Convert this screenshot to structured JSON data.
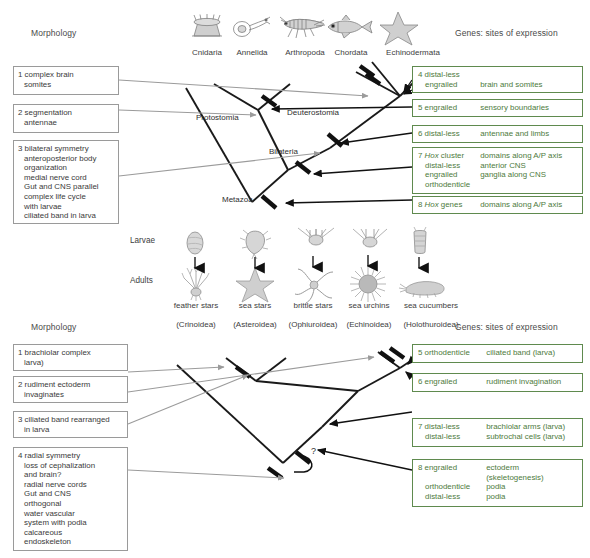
{
  "panels": {
    "top": {
      "left_header": "Morphology",
      "right_header": "Genes: sites of expression",
      "taxa": [
        {
          "name": "Cnidaria",
          "icon": "cnidaria-polyp-icon"
        },
        {
          "name": "Annelida",
          "icon": "annelida-worm-icon"
        },
        {
          "name": "Arthropoda",
          "icon": "arthropoda-insect-icon"
        },
        {
          "name": "Chordata",
          "icon": "chordata-fish-icon"
        },
        {
          "name": "Echinodermata",
          "icon": "echinodermata-star-icon"
        }
      ],
      "morphology_boxes": [
        {
          "num": "1",
          "lines": [
            "complex brain",
            "somites"
          ]
        },
        {
          "num": "2",
          "lines": [
            "segmentation",
            "antennae"
          ]
        },
        {
          "num": "3",
          "lines": [
            "bilateral symmetry",
            "anteroposterior body",
            "organization",
            "medial nerve cord",
            "Gut and CNS parallel",
            "complex life cycle",
            "with larvae",
            "ciliated band in larva"
          ]
        }
      ],
      "gene_boxes": [
        {
          "num": "4",
          "rows": [
            {
              "gene": "distal-less",
              "gene_italic": "",
              "site": ""
            },
            {
              "gene": "engrailed",
              "gene_italic": "",
              "site": "brain and somites"
            }
          ]
        },
        {
          "num": "5",
          "rows": [
            {
              "gene": "engrailed",
              "gene_italic": "",
              "site": "sensory boundaries"
            }
          ]
        },
        {
          "num": "6",
          "rows": [
            {
              "gene": "distal-less",
              "gene_italic": "",
              "site": "antennae and limbs"
            }
          ]
        },
        {
          "num": "7",
          "rows": [
            {
              "gene": "cluster",
              "gene_italic": "Hox",
              "site": "domains along A/P axis"
            },
            {
              "gene": "distal-less",
              "gene_italic": "",
              "site": "anterior CNS"
            },
            {
              "gene": "engrailed",
              "gene_italic": "",
              "site": "ganglia along CNS"
            },
            {
              "gene": "orthodenticle",
              "gene_italic": "",
              "site": ""
            }
          ]
        },
        {
          "num": "8",
          "rows": [
            {
              "gene": "genes",
              "gene_italic": "Hox",
              "site": "domains along A/P axis"
            }
          ]
        }
      ],
      "tree_nodes": [
        "Protostomia",
        "Deuterostomia",
        "Bilateria",
        "Metazoa"
      ]
    },
    "middle": {
      "row_labels": [
        "Larvae",
        "Adults"
      ],
      "taxa": [
        {
          "common": "feather stars",
          "latin": "(Crinoidea)",
          "larva_icon": "crinoid-larva-icon",
          "adult_icon": "feather-star-icon"
        },
        {
          "common": "sea stars",
          "latin": "(Asteroidea)",
          "larva_icon": "bipinnaria-larva-icon",
          "adult_icon": "sea-star-icon"
        },
        {
          "common": "brittle stars",
          "latin": "(Ophiuroidea)",
          "larva_icon": "ophiopluteus-larva-icon",
          "adult_icon": "brittle-star-icon"
        },
        {
          "common": "sea urchins",
          "latin": "(Echinoidea)",
          "larva_icon": "echinopluteus-larva-icon",
          "adult_icon": "sea-urchin-icon"
        },
        {
          "common": "sea cucumbers",
          "latin": "(Holothuroidea)",
          "larva_icon": "auricularia-larva-icon",
          "adult_icon": "sea-cucumber-icon"
        }
      ]
    },
    "bottom": {
      "left_header": "Morphology",
      "right_header": "Genes: sites of expression",
      "morphology_boxes": [
        {
          "num": "1",
          "lines": [
            "brachiolar complex",
            "larva)"
          ]
        },
        {
          "num": "2",
          "lines": [
            "rudiment ectoderm",
            "invaginates"
          ]
        },
        {
          "num": "3",
          "lines": [
            "ciliated band rearranged",
            "in larva"
          ]
        },
        {
          "num": "4",
          "lines": [
            "radial symmetry",
            "loss of cephalization",
            "and brain?",
            "radial nerve cords",
            "Gut and CNS",
            "orthogonal",
            "water vascular",
            "system with podia",
            "calcareous",
            "endoskeleton"
          ]
        }
      ],
      "gene_boxes": [
        {
          "num": "5",
          "rows": [
            {
              "gene": "orthodenticle",
              "gene_italic": "",
              "site": "ciliated band  (larva)"
            }
          ]
        },
        {
          "num": "6",
          "rows": [
            {
              "gene": "engrailed",
              "gene_italic": "",
              "site": "rudiment invagination"
            }
          ]
        },
        {
          "num": "7",
          "rows": [
            {
              "gene": "distal-less",
              "gene_italic": "",
              "site": "brachiolar arms (larva)"
            },
            {
              "gene": "distal-less",
              "gene_italic": "",
              "site": "subtrochal cells (larva)"
            }
          ]
        },
        {
          "num": "8",
          "rows": [
            {
              "gene": "engrailed",
              "gene_italic": "",
              "site": "ectoderm"
            },
            {
              "gene": "",
              "gene_italic": "",
              "site": "(skeletogenesis)"
            },
            {
              "gene": "orthodenticle",
              "gene_italic": "",
              "site": "podia"
            },
            {
              "gene": "distal-less",
              "gene_italic": "",
              "site": "podia"
            }
          ]
        }
      ],
      "uncertainty_marker": "?"
    }
  },
  "colors": {
    "gene_box_border": "#5f8a4e",
    "gene_box_text": "#4d7a3c",
    "morph_box_border": "#9a9a9a",
    "tree_line": "#1a1a1a",
    "leader_line": "#9b9b9b",
    "text": "#3a3a3a"
  }
}
